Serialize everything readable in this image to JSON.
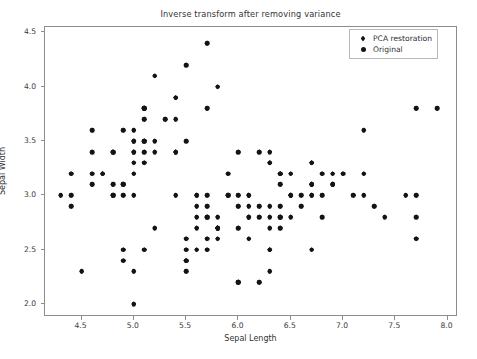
{
  "chart_data": {
    "type": "scatter",
    "title": "Inverse transform after removing variance",
    "xlabel": "Sepal Length",
    "ylabel": "Sepal Width",
    "xlim": [
      4.15,
      8.1
    ],
    "ylim": [
      1.88,
      4.55
    ],
    "xticks": [
      4.5,
      5.0,
      5.5,
      6.0,
      6.5,
      7.0,
      7.5,
      8.0
    ],
    "xticklabels": [
      "4.5",
      "5.0",
      "5.5",
      "6.0",
      "6.5",
      "7.0",
      "7.5",
      "8.0"
    ],
    "yticks": [
      2.0,
      2.5,
      3.0,
      3.5,
      4.0,
      4.5
    ],
    "yticklabels": [
      "2.0",
      "2.5",
      "3.0",
      "3.5",
      "4.0",
      "4.5"
    ],
    "grid": false,
    "legend_position": "upper right",
    "marker_color": "#141414",
    "axis_color": "#8d8d8d",
    "background": "#ffffff",
    "series": [
      {
        "name": "PCA restoration",
        "marker": "diamond",
        "color": "#141414",
        "points": [
          [
            5.1,
            3.5
          ],
          [
            4.9,
            3.0
          ],
          [
            4.7,
            3.2
          ],
          [
            4.6,
            3.1
          ],
          [
            5.0,
            3.6
          ],
          [
            5.4,
            3.9
          ],
          [
            4.6,
            3.4
          ],
          [
            5.0,
            3.4
          ],
          [
            4.4,
            2.9
          ],
          [
            4.9,
            3.1
          ],
          [
            5.4,
            3.7
          ],
          [
            4.8,
            3.4
          ],
          [
            4.8,
            3.0
          ],
          [
            4.3,
            3.0
          ],
          [
            5.8,
            4.0
          ],
          [
            5.7,
            4.4
          ],
          [
            5.4,
            3.9
          ],
          [
            5.1,
            3.5
          ],
          [
            5.7,
            3.8
          ],
          [
            5.1,
            3.8
          ],
          [
            5.4,
            3.4
          ],
          [
            5.1,
            3.7
          ],
          [
            4.6,
            3.6
          ],
          [
            5.1,
            3.3
          ],
          [
            4.8,
            3.4
          ],
          [
            5.0,
            3.0
          ],
          [
            5.0,
            3.4
          ],
          [
            5.2,
            3.5
          ],
          [
            5.2,
            3.4
          ],
          [
            4.7,
            3.2
          ],
          [
            4.8,
            3.1
          ],
          [
            5.4,
            3.4
          ],
          [
            5.2,
            4.1
          ],
          [
            5.5,
            4.2
          ],
          [
            4.9,
            3.1
          ],
          [
            5.0,
            3.2
          ],
          [
            5.5,
            3.5
          ],
          [
            4.9,
            3.6
          ],
          [
            4.4,
            3.0
          ],
          [
            5.1,
            3.4
          ],
          [
            5.0,
            3.5
          ],
          [
            4.5,
            2.3
          ],
          [
            4.4,
            3.2
          ],
          [
            5.0,
            3.5
          ],
          [
            5.1,
            3.8
          ],
          [
            4.8,
            3.0
          ],
          [
            5.1,
            3.8
          ],
          [
            4.6,
            3.2
          ],
          [
            5.3,
            3.7
          ],
          [
            5.0,
            3.3
          ],
          [
            7.0,
            3.2
          ],
          [
            6.4,
            3.2
          ],
          [
            6.9,
            3.1
          ],
          [
            5.5,
            2.3
          ],
          [
            6.5,
            2.8
          ],
          [
            5.7,
            2.8
          ],
          [
            6.3,
            3.3
          ],
          [
            4.9,
            2.4
          ],
          [
            6.6,
            2.9
          ],
          [
            5.2,
            2.7
          ],
          [
            5.0,
            2.0
          ],
          [
            5.9,
            3.0
          ],
          [
            6.0,
            2.2
          ],
          [
            6.1,
            2.9
          ],
          [
            5.6,
            2.9
          ],
          [
            6.7,
            3.1
          ],
          [
            5.6,
            3.0
          ],
          [
            5.8,
            2.7
          ],
          [
            6.2,
            2.2
          ],
          [
            5.6,
            2.5
          ],
          [
            5.9,
            3.2
          ],
          [
            6.1,
            2.8
          ],
          [
            6.3,
            2.5
          ],
          [
            6.1,
            2.8
          ],
          [
            6.4,
            2.9
          ],
          [
            6.6,
            3.0
          ],
          [
            6.8,
            2.8
          ],
          [
            6.7,
            3.0
          ],
          [
            6.0,
            2.9
          ],
          [
            5.7,
            2.6
          ],
          [
            5.5,
            2.4
          ],
          [
            5.5,
            2.4
          ],
          [
            5.8,
            2.7
          ],
          [
            6.0,
            2.7
          ],
          [
            5.4,
            3.0
          ],
          [
            6.0,
            3.4
          ],
          [
            6.7,
            3.1
          ],
          [
            6.3,
            2.3
          ],
          [
            5.6,
            3.0
          ],
          [
            5.5,
            2.5
          ],
          [
            5.5,
            2.6
          ],
          [
            6.1,
            3.0
          ],
          [
            5.8,
            2.6
          ],
          [
            5.0,
            2.3
          ],
          [
            5.6,
            2.7
          ],
          [
            5.7,
            3.0
          ],
          [
            5.7,
            2.9
          ],
          [
            6.2,
            2.9
          ],
          [
            5.1,
            2.5
          ],
          [
            5.7,
            2.8
          ],
          [
            6.3,
            3.3
          ],
          [
            5.8,
            2.7
          ],
          [
            7.1,
            3.0
          ],
          [
            6.3,
            2.9
          ],
          [
            6.5,
            3.0
          ],
          [
            7.6,
            3.0
          ],
          [
            4.9,
            2.5
          ],
          [
            7.3,
            2.9
          ],
          [
            6.7,
            2.5
          ],
          [
            7.2,
            3.6
          ],
          [
            6.5,
            3.2
          ],
          [
            6.4,
            2.7
          ],
          [
            6.8,
            3.0
          ],
          [
            5.7,
            2.5
          ],
          [
            5.8,
            2.8
          ],
          [
            6.4,
            3.2
          ],
          [
            6.5,
            3.0
          ],
          [
            7.7,
            3.8
          ],
          [
            7.7,
            2.6
          ],
          [
            6.0,
            2.2
          ],
          [
            6.9,
            3.2
          ],
          [
            5.6,
            2.8
          ],
          [
            7.7,
            2.8
          ],
          [
            6.3,
            2.7
          ],
          [
            6.7,
            3.3
          ],
          [
            7.2,
            3.2
          ],
          [
            6.2,
            2.8
          ],
          [
            6.1,
            3.0
          ],
          [
            6.4,
            2.8
          ],
          [
            7.2,
            3.0
          ],
          [
            7.4,
            2.8
          ],
          [
            7.9,
            3.8
          ],
          [
            6.4,
            2.8
          ],
          [
            6.3,
            2.8
          ],
          [
            6.1,
            2.6
          ],
          [
            7.7,
            3.0
          ],
          [
            6.3,
            3.4
          ],
          [
            6.4,
            3.1
          ],
          [
            6.0,
            3.0
          ],
          [
            6.9,
            3.1
          ],
          [
            6.7,
            3.1
          ],
          [
            6.9,
            3.1
          ],
          [
            5.8,
            2.7
          ],
          [
            6.8,
            3.2
          ],
          [
            6.7,
            3.3
          ],
          [
            6.7,
            3.0
          ],
          [
            6.3,
            2.5
          ],
          [
            6.5,
            3.0
          ],
          [
            6.2,
            3.4
          ],
          [
            5.9,
            3.0
          ]
        ]
      },
      {
        "name": "Original",
        "marker": "circle",
        "color": "#141414",
        "points": [
          [
            5.1,
            3.5
          ],
          [
            4.9,
            3.0
          ],
          [
            4.7,
            3.2
          ],
          [
            4.6,
            3.1
          ],
          [
            5.0,
            3.6
          ],
          [
            5.4,
            3.9
          ],
          [
            4.6,
            3.4
          ],
          [
            5.0,
            3.4
          ],
          [
            4.4,
            2.9
          ],
          [
            4.9,
            3.1
          ],
          [
            5.4,
            3.7
          ],
          [
            4.8,
            3.4
          ],
          [
            4.8,
            3.0
          ],
          [
            4.3,
            3.0
          ],
          [
            5.8,
            4.0
          ],
          [
            5.7,
            4.4
          ],
          [
            5.4,
            3.9
          ],
          [
            5.1,
            3.5
          ],
          [
            5.7,
            3.8
          ],
          [
            5.1,
            3.8
          ],
          [
            5.4,
            3.4
          ],
          [
            5.1,
            3.7
          ],
          [
            4.6,
            3.6
          ],
          [
            5.1,
            3.3
          ],
          [
            4.8,
            3.4
          ],
          [
            5.0,
            3.0
          ],
          [
            5.0,
            3.4
          ],
          [
            5.2,
            3.5
          ],
          [
            5.2,
            3.4
          ],
          [
            4.7,
            3.2
          ],
          [
            4.8,
            3.1
          ],
          [
            5.4,
            3.4
          ],
          [
            5.2,
            4.1
          ],
          [
            5.5,
            4.2
          ],
          [
            4.9,
            3.1
          ],
          [
            5.0,
            3.2
          ],
          [
            5.5,
            3.5
          ],
          [
            4.9,
            3.6
          ],
          [
            4.4,
            3.0
          ],
          [
            5.1,
            3.4
          ],
          [
            5.0,
            3.5
          ],
          [
            4.5,
            2.3
          ],
          [
            4.4,
            3.2
          ],
          [
            5.0,
            3.5
          ],
          [
            5.1,
            3.8
          ],
          [
            4.8,
            3.0
          ],
          [
            5.1,
            3.8
          ],
          [
            4.6,
            3.2
          ],
          [
            5.3,
            3.7
          ],
          [
            5.0,
            3.3
          ],
          [
            7.0,
            3.2
          ],
          [
            6.4,
            3.2
          ],
          [
            6.9,
            3.1
          ],
          [
            5.5,
            2.3
          ],
          [
            6.5,
            2.8
          ],
          [
            5.7,
            2.8
          ],
          [
            6.3,
            3.3
          ],
          [
            4.9,
            2.4
          ],
          [
            6.6,
            2.9
          ],
          [
            5.2,
            2.7
          ],
          [
            5.0,
            2.0
          ],
          [
            5.9,
            3.0
          ],
          [
            6.0,
            2.2
          ],
          [
            6.1,
            2.9
          ],
          [
            5.6,
            2.9
          ],
          [
            6.7,
            3.1
          ],
          [
            5.6,
            3.0
          ],
          [
            5.8,
            2.7
          ],
          [
            6.2,
            2.2
          ],
          [
            5.6,
            2.5
          ],
          [
            5.9,
            3.2
          ],
          [
            6.1,
            2.8
          ],
          [
            6.3,
            2.5
          ],
          [
            6.1,
            2.8
          ],
          [
            6.4,
            2.9
          ],
          [
            6.6,
            3.0
          ],
          [
            6.8,
            2.8
          ],
          [
            6.7,
            3.0
          ],
          [
            6.0,
            2.9
          ],
          [
            5.7,
            2.6
          ],
          [
            5.5,
            2.4
          ],
          [
            5.5,
            2.4
          ],
          [
            5.8,
            2.7
          ],
          [
            6.0,
            2.7
          ],
          [
            5.4,
            3.0
          ],
          [
            6.0,
            3.4
          ],
          [
            6.7,
            3.1
          ],
          [
            6.3,
            2.3
          ],
          [
            5.6,
            3.0
          ],
          [
            5.5,
            2.5
          ],
          [
            5.5,
            2.6
          ],
          [
            6.1,
            3.0
          ],
          [
            5.8,
            2.6
          ],
          [
            5.0,
            2.3
          ],
          [
            5.6,
            2.7
          ],
          [
            5.7,
            3.0
          ],
          [
            5.7,
            2.9
          ],
          [
            6.2,
            2.9
          ],
          [
            5.1,
            2.5
          ],
          [
            5.7,
            2.8
          ],
          [
            6.3,
            3.3
          ],
          [
            5.8,
            2.7
          ],
          [
            7.1,
            3.0
          ],
          [
            6.3,
            2.9
          ],
          [
            6.5,
            3.0
          ],
          [
            7.6,
            3.0
          ],
          [
            4.9,
            2.5
          ],
          [
            7.3,
            2.9
          ],
          [
            6.7,
            2.5
          ],
          [
            7.2,
            3.6
          ],
          [
            6.5,
            3.2
          ],
          [
            6.4,
            2.7
          ],
          [
            6.8,
            3.0
          ],
          [
            5.7,
            2.5
          ],
          [
            5.8,
            2.8
          ],
          [
            6.4,
            3.2
          ],
          [
            6.5,
            3.0
          ],
          [
            7.7,
            3.8
          ],
          [
            7.7,
            2.6
          ],
          [
            6.0,
            2.2
          ],
          [
            6.9,
            3.2
          ],
          [
            5.6,
            2.8
          ],
          [
            7.7,
            2.8
          ],
          [
            6.3,
            2.7
          ],
          [
            6.7,
            3.3
          ],
          [
            7.2,
            3.2
          ],
          [
            6.2,
            2.8
          ],
          [
            6.1,
            3.0
          ],
          [
            6.4,
            2.8
          ],
          [
            7.2,
            3.0
          ],
          [
            7.4,
            2.8
          ],
          [
            7.9,
            3.8
          ],
          [
            6.4,
            2.8
          ],
          [
            6.3,
            2.8
          ],
          [
            6.1,
            2.6
          ],
          [
            7.7,
            3.0
          ],
          [
            6.3,
            3.4
          ],
          [
            6.4,
            3.1
          ],
          [
            6.0,
            3.0
          ],
          [
            6.9,
            3.1
          ],
          [
            6.7,
            3.1
          ],
          [
            6.9,
            3.1
          ],
          [
            5.8,
            2.7
          ],
          [
            6.8,
            3.2
          ],
          [
            6.7,
            3.3
          ],
          [
            6.7,
            3.0
          ],
          [
            6.3,
            2.5
          ],
          [
            6.5,
            3.0
          ],
          [
            6.2,
            3.4
          ],
          [
            5.9,
            3.0
          ]
        ]
      }
    ]
  },
  "legend": {
    "entries": [
      {
        "label": "PCA restoration",
        "marker": "diamond-icon"
      },
      {
        "label": "Original",
        "marker": "circle-icon"
      }
    ]
  }
}
